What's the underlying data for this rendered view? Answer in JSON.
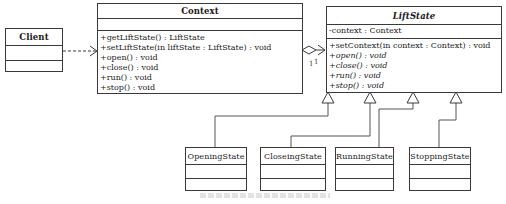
{
  "diagram": {
    "type": "uml-class-diagram",
    "pattern": "State",
    "colors": {
      "line": "#3a3a3a",
      "background": "#ffffff",
      "text": "#1a1a1a"
    },
    "classes": {
      "client": {
        "name": "Client",
        "attributes": [],
        "operations": []
      },
      "context": {
        "name": "Context",
        "attributes": [],
        "operations": [
          "+getLiftState() : LiftState",
          "+setLiftState(in liftState : LiftState) : void",
          "+open() : void",
          "+close() : void",
          "+run() : void",
          "+stop() : void"
        ]
      },
      "lift_state": {
        "name": "LiftState",
        "abstract": true,
        "attributes": [
          "-context : Context"
        ],
        "operations": [
          "+setContext(in context : Context) : void",
          "+open() : void",
          "+close() : void",
          "+run() : void",
          "+stop() : void"
        ]
      },
      "opening_state": {
        "name": "OpeningState"
      },
      "closeing_state": {
        "name": "CloseingState"
      },
      "running_state": {
        "name": "RunningState"
      },
      "stopping_state": {
        "name": "StoppingState"
      }
    },
    "relationships": [
      {
        "from": "Client",
        "to": "Context",
        "kind": "dependency"
      },
      {
        "from": "LiftState",
        "to": "Context",
        "kind": "aggregation",
        "multiplicity": "1"
      },
      {
        "from": "Context",
        "to": "LiftState",
        "kind": "association",
        "multiplicity": "1"
      },
      {
        "from": "OpeningState",
        "to": "LiftState",
        "kind": "generalization"
      },
      {
        "from": "CloseingState",
        "to": "LiftState",
        "kind": "generalization"
      },
      {
        "from": "RunningState",
        "to": "LiftState",
        "kind": "generalization"
      },
      {
        "from": "StoppingState",
        "to": "LiftState",
        "kind": "generalization"
      }
    ],
    "multiplicity_labels": {
      "left": "1",
      "right": "1"
    }
  }
}
